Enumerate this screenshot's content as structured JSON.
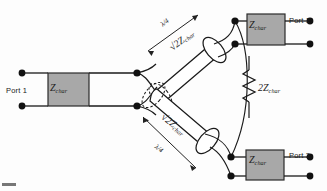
{
  "figure": {
    "background_color": "#fdfdfd",
    "line_color": "#1a1a1a",
    "box_fill_color": "#a8a8a8",
    "box_border_color": "#2b2b2b",
    "terminal_color": "#111111"
  },
  "ports": {
    "input": {
      "label": "Port 1"
    },
    "output_top": {
      "label": "Port 1"
    },
    "output_bottom": {
      "label": "Port 3"
    }
  },
  "impedance_boxes": {
    "input": {
      "symbol": "Z",
      "subscript": "char"
    },
    "output_top": {
      "symbol": "Z",
      "subscript": "char"
    },
    "output_bottom": {
      "symbol": "Z",
      "subscript": "char"
    }
  },
  "transmission_lines": {
    "top": {
      "impedance_prefix": "√2",
      "impedance_symbol": "Z",
      "impedance_subscript": "char",
      "length_label": "λ/4"
    },
    "bottom": {
      "impedance_prefix": "√2",
      "impedance_symbol": "Z",
      "impedance_subscript": "char",
      "length_label": "λ/4"
    }
  },
  "isolation_resistor": {
    "symbol": "2Z",
    "subscript": "char"
  }
}
